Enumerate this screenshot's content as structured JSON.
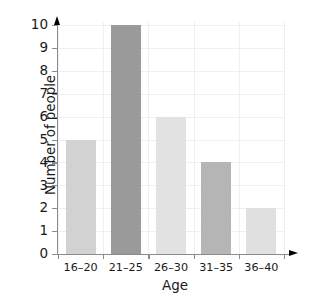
{
  "chart_data": {
    "type": "bar",
    "title": "",
    "xlabel": "Age",
    "ylabel": "Number of people",
    "categories": [
      "16–20",
      "21–25",
      "26–30",
      "31–35",
      "36–40"
    ],
    "values": [
      5,
      10,
      6,
      4,
      2
    ],
    "bar_colors": [
      "#d2d2d2",
      "#9a9a9a",
      "#e2e2e2",
      "#b5b5b5",
      "#e0e0e0"
    ],
    "ylim": [
      0,
      10
    ],
    "yticks": [
      0,
      1,
      2,
      3,
      4,
      5,
      6,
      7,
      8,
      9,
      10
    ],
    "ytick_labels": [
      "0",
      "1",
      "2",
      "3",
      "4",
      "5",
      "6",
      "7",
      "8",
      "9",
      "10"
    ],
    "grid": true,
    "grid_color": "#f0eef0",
    "axis_color": "#8c8c8c",
    "legend": null,
    "legend_position": "none",
    "background": "#ffffff"
  }
}
